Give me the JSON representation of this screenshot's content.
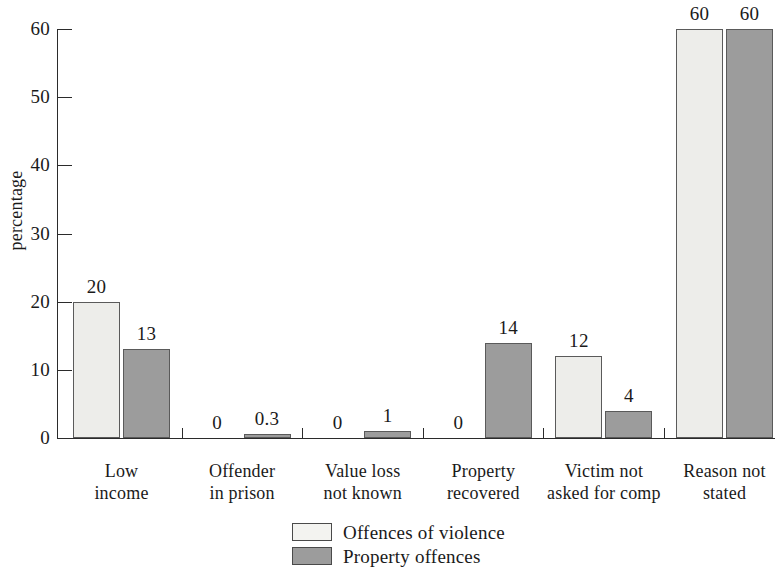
{
  "chart_data": {
    "type": "bar",
    "title": "",
    "xlabel": "",
    "ylabel": "percentage",
    "ylim": [
      0,
      60
    ],
    "yticks": [
      0,
      10,
      20,
      30,
      40,
      50,
      60
    ],
    "ytick_labels": [
      "0",
      "10",
      "20",
      "30",
      "40",
      "50",
      "60"
    ],
    "grid": false,
    "legend_position": "bottom-center",
    "categories": [
      "Low income",
      "Offender in prison",
      "Value loss not known",
      "Property recovered",
      "Victim not asked for comp",
      "Reason not stated"
    ],
    "category_lines": [
      [
        "Low",
        "income"
      ],
      [
        "Offender",
        "in prison"
      ],
      [
        "Value loss",
        "not known"
      ],
      [
        "Property",
        "recovered"
      ],
      [
        "Victim not",
        "asked for comp"
      ],
      [
        "Reason not",
        "stated"
      ]
    ],
    "series": [
      {
        "name": "Offences of violence",
        "color": "#ededea",
        "values": [
          20,
          0,
          0,
          0,
          12,
          60
        ],
        "value_labels": [
          "20",
          "0",
          "0",
          "0",
          "12",
          "60"
        ]
      },
      {
        "name": "Property offences",
        "color": "#9c9c9c",
        "values": [
          13,
          0.3,
          1,
          14,
          4,
          60
        ],
        "value_labels": [
          "13",
          "0.3",
          "1",
          "14",
          "4",
          "60"
        ]
      }
    ]
  },
  "legend": {
    "items": [
      {
        "label": "Offences of violence",
        "swatch": "light"
      },
      {
        "label": "Property offences",
        "swatch": "dark"
      }
    ]
  }
}
